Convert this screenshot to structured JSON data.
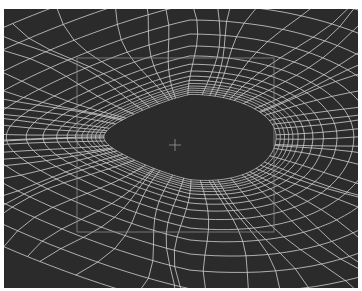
{
  "viewport": {
    "label": "3D wireframe viewport",
    "content": "eye socket mesh topology",
    "background_color": "#2b2b2b",
    "wire_color": "#d8d8d8",
    "bbox_color": "#8a8a8a",
    "crosshair_color": "#9a9a9a"
  },
  "selection_box": {
    "x": 73,
    "y": 49,
    "width": 197,
    "height": 174
  },
  "pivot": {
    "x": 171,
    "y": 136
  }
}
